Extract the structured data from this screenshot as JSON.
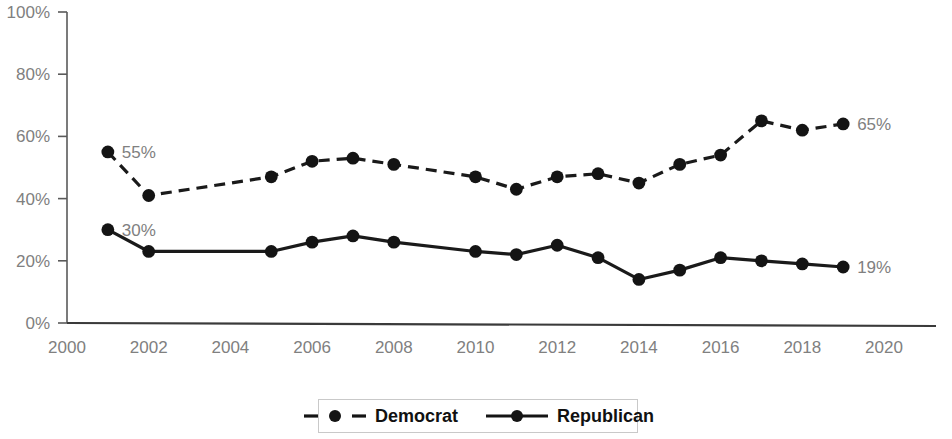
{
  "chart_data": {
    "type": "line",
    "title": "",
    "subtitle": "",
    "xlabel": "",
    "ylabel": "",
    "xlim": [
      2000,
      2020
    ],
    "ylim": [
      0,
      100
    ],
    "grid": false,
    "legend_position": "bottom",
    "x_tick_labels": [
      "2000",
      "2002",
      "2004",
      "2006",
      "2008",
      "2010",
      "2012",
      "2014",
      "2016",
      "2018",
      "2020"
    ],
    "x_ticks": [
      2000,
      2002,
      2004,
      2006,
      2008,
      2010,
      2012,
      2014,
      2016,
      2018,
      2020
    ],
    "y_tick_labels": [
      "0%",
      "20%",
      "40%",
      "60%",
      "80%",
      "100%"
    ],
    "y_ticks": [
      0,
      20,
      40,
      60,
      80,
      100
    ],
    "series": [
      {
        "name": "Democrat",
        "style": "dashed",
        "marker": "circle",
        "color": "#141414",
        "x": [
          2001,
          2002,
          2005,
          2006,
          2007,
          2008,
          2010,
          2011,
          2012,
          2013,
          2014,
          2015,
          2016,
          2017,
          2018,
          2019
        ],
        "values": [
          55,
          41,
          47,
          52,
          53,
          51,
          47,
          43,
          47,
          48,
          45,
          51,
          54,
          65,
          62,
          64
        ]
      },
      {
        "name": "Republican",
        "style": "solid",
        "marker": "circle",
        "color": "#141414",
        "x": [
          2001,
          2002,
          2005,
          2006,
          2007,
          2008,
          2010,
          2011,
          2012,
          2013,
          2014,
          2015,
          2016,
          2017,
          2018,
          2019
        ],
        "values": [
          30,
          23,
          23,
          26,
          28,
          26,
          23,
          22,
          25,
          21,
          14,
          17,
          21,
          20,
          19,
          18
        ]
      }
    ],
    "annotations": [
      {
        "id": "dem-start",
        "text": "55%",
        "x": 2001,
        "y": 55,
        "align": "right"
      },
      {
        "id": "rep-start",
        "text": "30%",
        "x": 2001,
        "y": 30,
        "align": "right"
      },
      {
        "id": "dem-end",
        "text": "65%",
        "x": 2019,
        "y": 64,
        "align": "right"
      },
      {
        "id": "rep-end",
        "text": "19%",
        "x": 2019,
        "y": 18,
        "align": "right"
      }
    ]
  },
  "legend": {
    "items": [
      {
        "label": "Democrat",
        "style": "dashed"
      },
      {
        "label": "Republican",
        "style": "solid"
      }
    ]
  },
  "axis_labels": {
    "y": [
      "100%",
      "80%",
      "60%",
      "40%",
      "20%",
      "0%"
    ],
    "x": [
      "2000",
      "2002",
      "2004",
      "2006",
      "2008",
      "2010",
      "2012",
      "2014",
      "2016",
      "2018",
      "2020"
    ]
  },
  "endpoint_labels": {
    "dem_start": "55%",
    "rep_start": "30%",
    "dem_end": "65%",
    "rep_end": "19%"
  },
  "colors": {
    "series": "#141414",
    "axis": "#5a5a5a",
    "tick_text": "#808080",
    "legend_text": "#111111",
    "background": "#ffffff"
  }
}
